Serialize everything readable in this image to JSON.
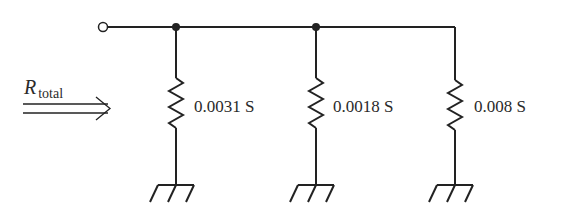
{
  "diagram": {
    "type": "parallel-circuit",
    "input_label": {
      "symbol": "R",
      "subscript": "total"
    },
    "branches": [
      {
        "id": "r1",
        "value": "0.0031 S"
      },
      {
        "id": "r2",
        "value": "0.0018 S"
      },
      {
        "id": "r3",
        "value": "0.008 S"
      }
    ],
    "colors": {
      "line": "#222222",
      "text": "#2a2a2a"
    }
  }
}
